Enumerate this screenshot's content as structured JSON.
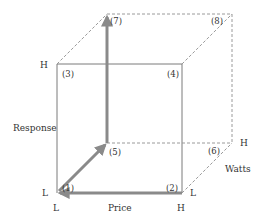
{
  "diagram": {
    "title": "",
    "axes": {
      "price": {
        "label": "Price",
        "low": "L",
        "high": "H"
      },
      "response": {
        "label": "Response",
        "low": "L",
        "high": "H"
      },
      "watts": {
        "label": "Watts",
        "low": "L",
        "high": "H"
      }
    },
    "vertices": [
      "(1)",
      "(2)",
      "(3)",
      "(4)",
      "(5)",
      "(6)",
      "(7)",
      "(8)"
    ],
    "colors": {
      "edge": "#7a7a7a",
      "hidden_edge": "#9a9a9a",
      "arrow": "#8a8a8a",
      "text": "#333333"
    }
  }
}
